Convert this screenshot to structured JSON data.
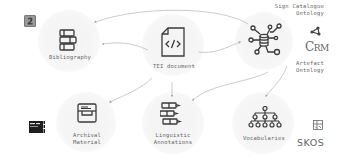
{
  "nodes": {
    "tei_document": {
      "label": "TEI document",
      "icon": "code-file-icon"
    },
    "bibliography": {
      "label": "Bibliography",
      "icon": "books-icon"
    },
    "ontology": {
      "label": "",
      "icon": "database-network-icon"
    },
    "archival_material": {
      "label_line1": "Archival",
      "label_line2": "Material",
      "icon": "archive-drawer-icon"
    },
    "linguistic_annotations": {
      "label_line1": "Linguistic",
      "label_line2": "Annotations",
      "icon": "battery-bars-icon"
    },
    "vocabularies": {
      "label": "Vocabularies",
      "icon": "hierarchy-tree-icon"
    }
  },
  "ontology_labels": {
    "sign_catalogue_line1": "Sign Catalogue",
    "sign_catalogue_line2": "Ontology",
    "artefact_line1": "Artefact",
    "artefact_line2": "Ontology"
  },
  "logos": {
    "crm_text_c": "C",
    "crm_text_rm": "RM",
    "skos_text": "SKOS",
    "zotero": "zotero-logo-icon",
    "archive": "archive-logo-icon"
  },
  "edges": [
    {
      "from": "tei_document",
      "to": "bibliography"
    },
    {
      "from": "tei_document",
      "to": "ontology"
    },
    {
      "from": "tei_document",
      "to": "archival_material"
    },
    {
      "from": "tei_document",
      "to": "linguistic_annotations"
    },
    {
      "from": "ontology",
      "to": "bibliography"
    },
    {
      "from": "ontology",
      "to": "linguistic_annotations"
    },
    {
      "from": "ontology",
      "to": "vocabularies"
    }
  ],
  "colors": {
    "stroke": "#3a3a3a",
    "edge": "#aaaaaa",
    "circle": "#f4f4f4"
  }
}
